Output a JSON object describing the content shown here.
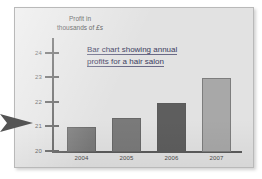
{
  "slide": {
    "background_color": "#e2e2e2",
    "border_color": "#b9b9b9"
  },
  "pointer": {
    "name": "arrow-pointer",
    "color": "#555555",
    "points_to": "21"
  },
  "chart_data": {
    "type": "bar",
    "title": "Bar chart showing annual profits for a hair salon",
    "title_line_1": "Bar chart showing annual",
    "title_line_2": "profits for a hair salon",
    "categories": [
      "2004",
      "2005",
      "2006",
      "2007"
    ],
    "values": [
      21,
      21.4,
      22,
      23
    ],
    "xlabel": "",
    "ylabel": "Profit in thousands of £s",
    "ylabel_line_1": "Profit in",
    "ylabel_line_2_prefix": "thousands of ",
    "ylabel_line_2_currency": "£s",
    "ylim": [
      20,
      24.6
    ],
    "yticks": [
      "24",
      "23",
      "22",
      "21",
      "20"
    ],
    "ytick_values": [
      24,
      23,
      22,
      21,
      20
    ],
    "grid": false,
    "legend": "none",
    "bar_colors": [
      "#7a7a7a",
      "#7a7a7a",
      "#5e5e5e",
      "#a8a8a8"
    ],
    "axis_color": "#5b5b5b",
    "title_color": "#3b3b5e"
  }
}
